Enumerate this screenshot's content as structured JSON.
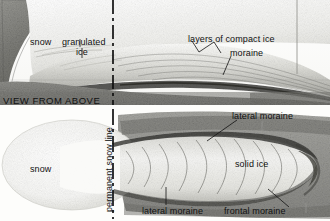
{
  "figure": {
    "panels": [
      {
        "id": "profile",
        "caption": "",
        "labels": [
          {
            "name": "snow",
            "text": "snow"
          },
          {
            "name": "granulated-ice",
            "text": "granulated ice"
          },
          {
            "name": "layers-of-compact-ice",
            "text": "layers of compact ice"
          },
          {
            "name": "moraine",
            "text": "moraine"
          }
        ]
      },
      {
        "id": "plan",
        "caption": "VIEW FROM ABOVE",
        "labels": [
          {
            "name": "snow",
            "text": "snow"
          },
          {
            "name": "permanent-snow-line",
            "text": "permanent snow line"
          },
          {
            "name": "lateral-moraine-upper",
            "text": "lateral moraine"
          },
          {
            "name": "solid-ice",
            "text": "solid ice"
          },
          {
            "name": "lateral-moraine-lower",
            "text": "lateral moraine"
          },
          {
            "name": "frontal-moraine",
            "text": "frontal moraine"
          }
        ]
      }
    ]
  },
  "text": {
    "snow_top": "snow",
    "granulated_ice_l1": "granulated",
    "granulated_ice_l2": "ice",
    "layers_of_compact_ice": "layers of compact ice",
    "moraine": "moraine",
    "view_from_above": "VIEW FROM ABOVE",
    "snow_bottom": "snow",
    "permanent_snow_line": "permanent snow line",
    "lateral_moraine_upper": "lateral moraine",
    "solid_ice": "solid ice",
    "lateral_moraine_lower": "lateral moraine",
    "frontal_moraine": "frontal moraine"
  },
  "colors": {
    "ink": "#111111",
    "paper": "#fdfdfb",
    "rock_dark": "#6e6e6a",
    "rock_mid": "#8d8d88",
    "ice_light": "#f2f2ef",
    "ice_shade": "#c9c9c4",
    "moraine_dark": "#3a3a38"
  }
}
